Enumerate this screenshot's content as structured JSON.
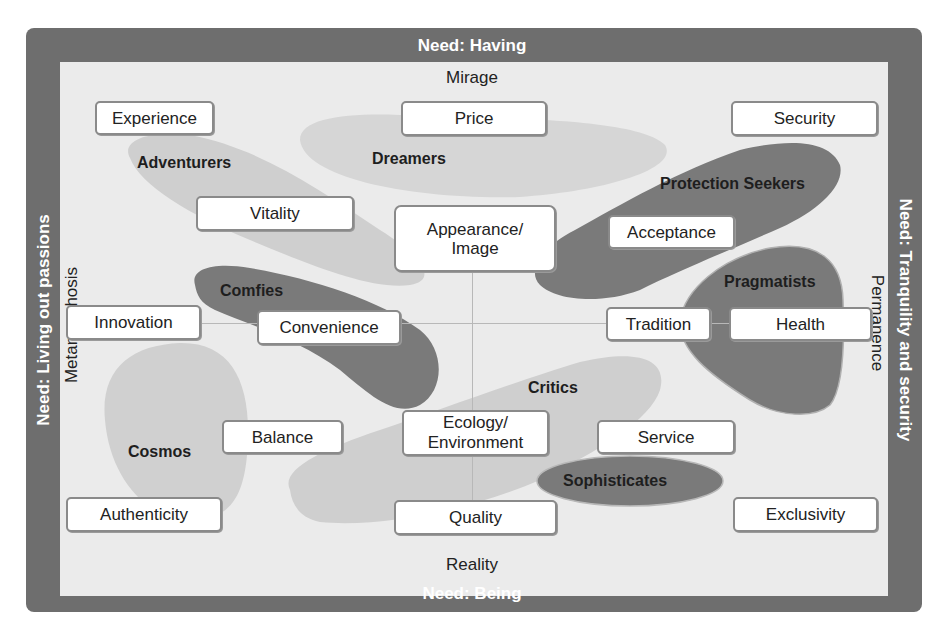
{
  "diagram": {
    "needs": {
      "top": "Need: Having",
      "bottom": "Need: Being",
      "left": "Need: Living out passions",
      "right": "Need: Tranquility and security"
    },
    "axes": {
      "top": "Mirage",
      "bottom": "Reality",
      "left": "Metamorphosis",
      "right": "Permanence"
    },
    "values": [
      {
        "label": "Experience"
      },
      {
        "label": "Price"
      },
      {
        "label": "Security"
      },
      {
        "label": "Vitality"
      },
      {
        "label": "Appearance/\nImage"
      },
      {
        "label": "Acceptance"
      },
      {
        "label": "Innovation"
      },
      {
        "label": "Convenience"
      },
      {
        "label": "Tradition"
      },
      {
        "label": "Health"
      },
      {
        "label": "Balance"
      },
      {
        "label": "Ecology/\nEnvironment"
      },
      {
        "label": "Service"
      },
      {
        "label": "Authenticity"
      },
      {
        "label": "Quality"
      },
      {
        "label": "Exclusivity"
      }
    ],
    "segments": [
      {
        "label": "Adventurers",
        "shade": "light"
      },
      {
        "label": "Dreamers",
        "shade": "light"
      },
      {
        "label": "Protection Seekers",
        "shade": "dark"
      },
      {
        "label": "Pragmatists",
        "shade": "dark"
      },
      {
        "label": "Comfies",
        "shade": "dark"
      },
      {
        "label": "Cosmos",
        "shade": "light"
      },
      {
        "label": "Critics",
        "shade": "light"
      },
      {
        "label": "Sophisticates",
        "shade": "dark"
      }
    ],
    "colors": {
      "frame": "#6e6e6e",
      "background": "#ebebeb",
      "light_segment": "#cfcfcf",
      "dark_segment": "#7a7a7a",
      "box_fill": "#ffffff",
      "box_border": "#8a8a8a"
    }
  }
}
